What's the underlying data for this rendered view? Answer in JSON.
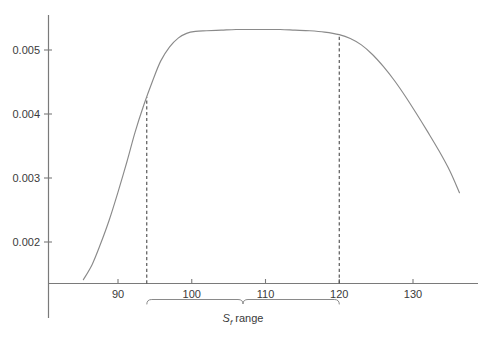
{
  "chart_data": {
    "type": "line",
    "title": "",
    "subtitle": "",
    "xlabel": "",
    "ylabel": "",
    "xlim": [
      85.0,
      136.8
    ],
    "ylim": [
      0.00136,
      0.00555
    ],
    "grid": false,
    "legend": null,
    "x_ticks": [
      90,
      100,
      110,
      120,
      130
    ],
    "x_tick_labels": [
      "90",
      "100",
      "110",
      "120",
      "130"
    ],
    "y_ticks": [
      0.002,
      0.003,
      0.004,
      0.005
    ],
    "y_tick_labels": [
      "0.002",
      "0.003",
      "0.004",
      "0.005"
    ],
    "series": [
      {
        "name": "curve",
        "color": "#8a8a8a",
        "x": [
          85.3,
          86.5,
          87.6,
          88.8,
          90.0,
          91.2,
          92.3,
          93.5,
          94.7,
          95.8,
          97.0,
          98.2,
          99.3,
          100.5,
          102.0,
          104.0,
          106.0,
          108.0,
          110.0,
          112.0,
          114.0,
          116.0,
          118.0,
          120.0,
          121.5,
          123.0,
          124.5,
          126.0,
          127.5,
          129.0,
          130.5,
          132.0,
          133.5,
          135.0,
          136.3
        ],
        "y": [
          0.00141,
          0.00165,
          0.00196,
          0.00234,
          0.00278,
          0.00325,
          0.00371,
          0.00414,
          0.00452,
          0.00483,
          0.00505,
          0.00519,
          0.00526,
          0.00529,
          0.0053,
          0.00531,
          0.00532,
          0.00532,
          0.00532,
          0.00532,
          0.00531,
          0.0053,
          0.00528,
          0.00524,
          0.00518,
          0.00508,
          0.00493,
          0.00474,
          0.00452,
          0.00427,
          0.004,
          0.00372,
          0.00343,
          0.00311,
          0.00277
        ]
      }
    ],
    "reference_lines": [
      {
        "name": "sf-range-lower",
        "x": 93.9,
        "style": "dashed",
        "color": "#4a4a4a"
      },
      {
        "name": "sf-range-upper",
        "x": 120.0,
        "style": "dashed",
        "color": "#4a4a4a"
      }
    ],
    "annotations": [
      {
        "name": "sf-range-bracket",
        "type": "brace",
        "x_start": 93.9,
        "x_end": 120.0,
        "label_prefix": "S",
        "label_subscript": "f",
        "label_suffix": " range"
      }
    ]
  },
  "axes": {
    "axis_color": "#7a7a7a",
    "tick_color": "#7a7a7a",
    "curve_color": "#8a8a8a",
    "text_color": "#3a3a3a",
    "background": "#ffffff"
  }
}
